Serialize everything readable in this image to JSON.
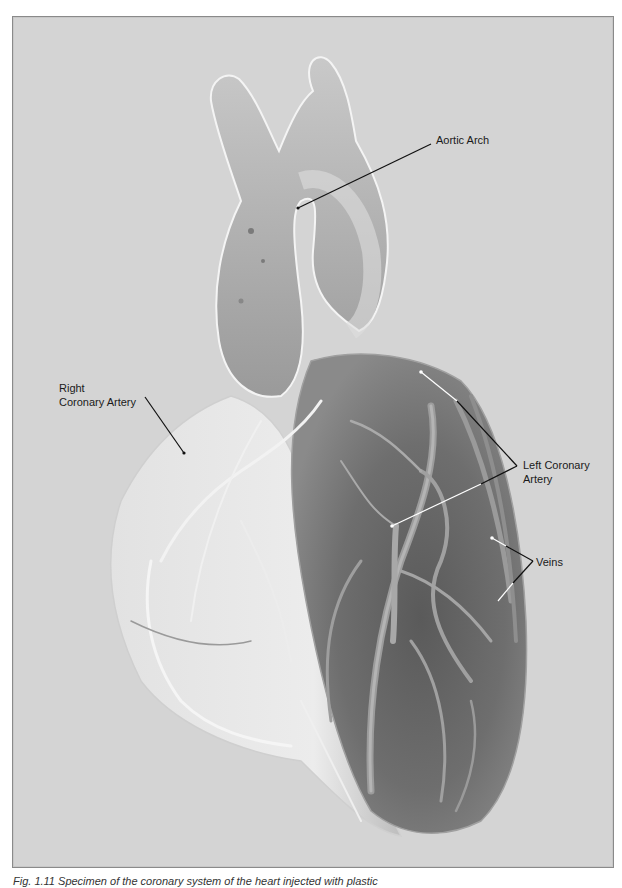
{
  "figure": {
    "background_color": "#d4d4d4",
    "border_color": "#8a8a8a",
    "labels": [
      {
        "id": "aortic-arch",
        "text": "Aortic Arch"
      },
      {
        "id": "right-coronary-artery",
        "line1": "Right",
        "line2": "Coronary Artery"
      },
      {
        "id": "left-coronary-artery",
        "line1": "Left Coronary",
        "line2": "Artery"
      },
      {
        "id": "veins",
        "text": "Veins"
      }
    ],
    "caption": "Fig. 1.11  Specimen of the coronary system of the heart injected with plastic"
  }
}
